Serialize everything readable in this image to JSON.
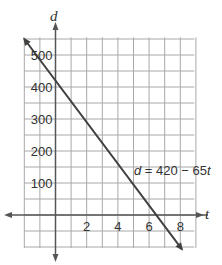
{
  "chart_data": {
    "type": "line",
    "title": "",
    "xlabel": "t",
    "ylabel": "d",
    "x_ticks": [
      2,
      4,
      6,
      8
    ],
    "y_ticks": [
      100,
      200,
      300,
      400,
      500
    ],
    "xlim": [
      -2,
      8.5
    ],
    "ylim": [
      -100,
      550
    ],
    "grid": true,
    "x_grid_step": 1,
    "y_grid_step": 50,
    "series": [
      {
        "name": "d = 420 − 65t",
        "equation": "d = 420 - 65t",
        "slope": -65,
        "intercept": 420,
        "x": [
          -2,
          0,
          2,
          4,
          6,
          6.46,
          8
        ],
        "values": [
          550,
          420,
          290,
          160,
          30,
          0,
          -100
        ]
      }
    ],
    "annotations": [
      {
        "text": "d = 420 − 65t",
        "x": 5.2,
        "y": 170
      }
    ]
  },
  "labels": {
    "x_axis": "t",
    "y_axis": "d",
    "equation_prefix": "d",
    "equation_rest": " = 420 − 65",
    "equation_var": "t",
    "x_ticks": [
      "2",
      "4",
      "6",
      "8"
    ],
    "y_ticks": [
      "100",
      "200",
      "300",
      "400",
      "500"
    ]
  },
  "colors": {
    "grid": "#a8a8a8",
    "axis": "#555555",
    "line": "#404040",
    "text": "#333333"
  }
}
